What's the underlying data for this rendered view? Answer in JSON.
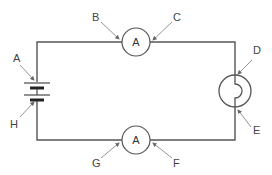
{
  "diagram": {
    "type": "series circuit",
    "components": {
      "ammeter_top": {
        "symbol": "A"
      },
      "ammeter_bottom": {
        "symbol": "A"
      },
      "battery": {
        "symbol": "cell pair"
      },
      "bulb": {
        "symbol": "lamp"
      }
    },
    "labels": {
      "A": "A",
      "B": "B",
      "C": "C",
      "D": "D",
      "E": "E",
      "F": "F",
      "G": "G",
      "H": "H"
    },
    "colors": {
      "wire": "#555555",
      "arrow": "#888888",
      "text": "#444444"
    }
  }
}
